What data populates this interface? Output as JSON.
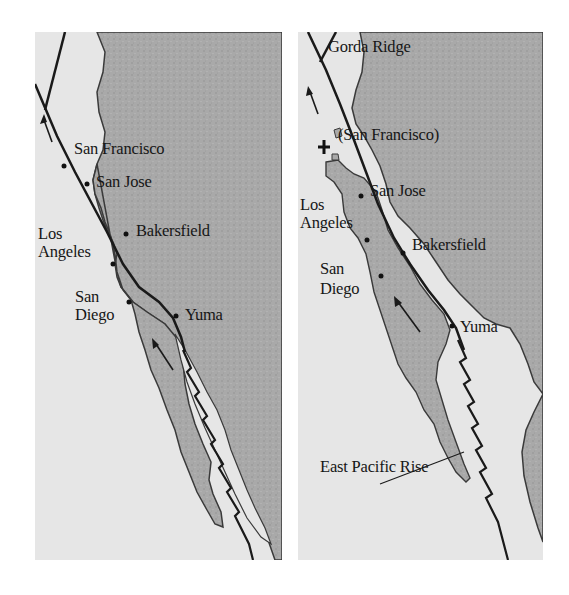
{
  "figure": {
    "panels": [
      {
        "id": "left",
        "description": "Present-day configuration",
        "labels": {
          "san_francisco": "San Francisco",
          "san_jose": "San Jose",
          "los": "Los",
          "angeles": "Angeles",
          "bakersfield": "Bakersfield",
          "san": "San",
          "diego": "Diego",
          "yuma": "Yuma"
        }
      },
      {
        "id": "right",
        "description": "Future configuration",
        "labels": {
          "gorda_ridge": "Gorda Ridge",
          "san_francisco": "(San Francisco)",
          "san_jose": "San Jose",
          "los": "Los",
          "angeles": "Angeles",
          "bakersfield": "Bakersfield",
          "san": "San",
          "diego": "Diego",
          "yuma": "Yuma",
          "east_pacific_rise": "East Pacific Rise"
        }
      }
    ],
    "colors": {
      "ocean": "#e6e6e6",
      "land": "#a9a9a9",
      "fault": "#1a1a1a",
      "text": "#161616"
    },
    "icons": [
      "plate-motion-arrow-icon",
      "city-dot-icon",
      "cross-marker-icon",
      "spreading-ridge-icon"
    ]
  }
}
